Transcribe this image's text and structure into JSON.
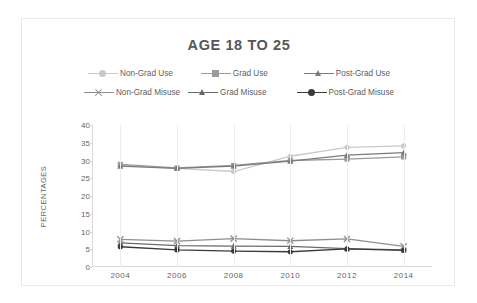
{
  "chart_data": {
    "type": "line",
    "title": "AGE 18 TO 25",
    "xlabel": "",
    "ylabel": "PERCENTAGES",
    "x": [
      2004,
      2006,
      2008,
      2010,
      2012,
      2014
    ],
    "xticklabels": [
      "2004",
      "2006",
      "2008",
      "2010",
      "2012",
      "2014"
    ],
    "yticklabels": [
      "0",
      "5",
      "10",
      "15",
      "20",
      "25",
      "30",
      "35",
      "40"
    ],
    "ylim": [
      0,
      40
    ],
    "ytick_step": 5,
    "grid": "vertical",
    "legend_position": "top",
    "series": [
      {
        "name": "Non-Grad Use",
        "values": [
          28.6,
          27.8,
          26.9,
          31.2,
          33.7,
          34.1
        ],
        "color": "#c9c9c9",
        "marker": "circle"
      },
      {
        "name": "Grad Use",
        "values": [
          28.9,
          27.9,
          28.6,
          30.0,
          30.4,
          31.0
        ],
        "color": "#9a9a9a",
        "marker": "square"
      },
      {
        "name": "Post-Grad Use",
        "values": [
          28.4,
          27.8,
          28.4,
          29.8,
          31.5,
          32.2
        ],
        "color": "#7b7b7b",
        "marker": "triangle"
      },
      {
        "name": "Non-Grad Misuse",
        "values": [
          7.8,
          7.3,
          8.0,
          7.4,
          7.9,
          5.8
        ],
        "color": "#8e8e8e",
        "marker": "x"
      },
      {
        "name": "Grad Misuse",
        "values": [
          6.8,
          6.0,
          5.9,
          5.8,
          5.2,
          4.8
        ],
        "color": "#6a6a6a",
        "marker": "triangle"
      },
      {
        "name": "Post-Grad Misuse",
        "values": [
          5.7,
          4.8,
          4.5,
          4.3,
          5.1,
          4.7
        ],
        "color": "#3a3a3a",
        "marker": "circle"
      }
    ]
  }
}
